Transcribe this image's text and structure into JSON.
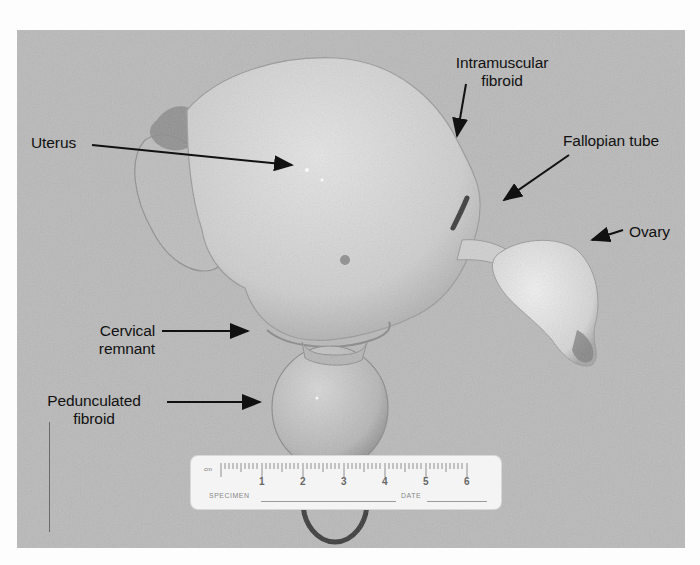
{
  "figure": {
    "type": "labeled gross pathology photograph",
    "background_color": "#b9b9b9",
    "specimen_color": "#d2d2d2"
  },
  "labels": {
    "uterus": "Uterus",
    "intramuscular_fibroid_line1": "Intramuscular",
    "intramuscular_fibroid_line2": "fibroid",
    "fallopian_tube": "Fallopian tube",
    "ovary": "Ovary",
    "cervical_remnant_line1": "Cervical",
    "cervical_remnant_line2": "remnant",
    "pedunculated_fibroid_line1": "Pedunculated",
    "pedunculated_fibroid_line2": "fibroid"
  },
  "ruler": {
    "unit": "cm",
    "numbers": [
      "1",
      "2",
      "3",
      "4",
      "5",
      "6"
    ],
    "specimen_label": "SPECIMEN",
    "date_label": "DATE"
  }
}
